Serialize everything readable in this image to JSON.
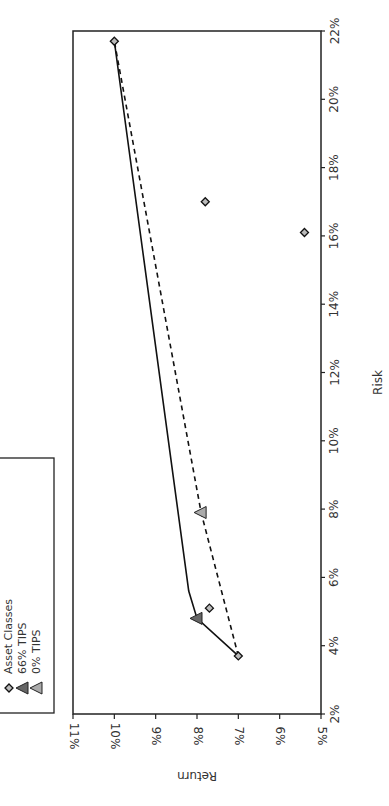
{
  "chart_data": {
    "type": "scatter",
    "orientation_note": "figure rotated 90 degrees counter-clockwise",
    "title": "",
    "xlabel": "Risk",
    "ylabel": "Return",
    "xlim": [
      0.02,
      0.22
    ],
    "ylim": [
      0.05,
      0.11
    ],
    "x_ticks": [
      "2%",
      "4%",
      "6%",
      "8%",
      "10%",
      "12%",
      "14%",
      "16%",
      "18%",
      "20%",
      "22%"
    ],
    "y_ticks": [
      "5%",
      "6%",
      "7%",
      "8%",
      "9%",
      "10%",
      "11%"
    ],
    "grid": false,
    "legend_position": "upper left",
    "series": [
      {
        "name": "Asset Classes",
        "marker": "diamond",
        "points": [
          {
            "risk": 0.037,
            "return": 0.07
          },
          {
            "risk": 0.051,
            "return": 0.077
          },
          {
            "risk": 0.161,
            "return": 0.054
          },
          {
            "risk": 0.17,
            "return": 0.078
          },
          {
            "risk": 0.217,
            "return": 0.1
          }
        ]
      },
      {
        "name": "66% TIPS",
        "marker": "triangle-dark",
        "line": "solid",
        "frontier": [
          {
            "risk": 0.037,
            "return": 0.07
          },
          {
            "risk": 0.048,
            "return": 0.08
          },
          {
            "risk": 0.056,
            "return": 0.082
          },
          {
            "risk": 0.217,
            "return": 0.1
          }
        ],
        "points": [
          {
            "risk": 0.048,
            "return": 0.08
          }
        ]
      },
      {
        "name": "0% TIPS",
        "marker": "triangle-light",
        "line": "dashed",
        "frontier": [
          {
            "risk": 0.037,
            "return": 0.07
          },
          {
            "risk": 0.079,
            "return": 0.079
          },
          {
            "risk": 0.217,
            "return": 0.1
          }
        ],
        "points": [
          {
            "risk": 0.079,
            "return": 0.079
          }
        ]
      }
    ]
  },
  "legend": {
    "items": [
      {
        "label": "Asset Classes"
      },
      {
        "label": "66% TIPS"
      },
      {
        "label": "0% TIPS"
      }
    ]
  },
  "axes": {
    "risk_label": "Risk",
    "return_label": "Return"
  }
}
